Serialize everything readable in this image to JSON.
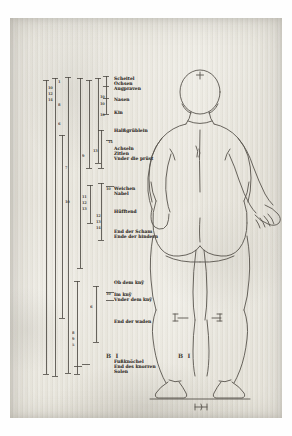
{
  "plate": {
    "title": "Vier Bücher von menschlicher Proportion – rear view female figure with proportional scales",
    "signature_left": "B I",
    "signature_right": "B I",
    "ink_color": "#3e3a34",
    "paper_color": "#e9e7df"
  },
  "labels": [
    {
      "text": "Scheitel",
      "x": 104,
      "y": 58
    },
    {
      "text": "Ochsen",
      "x": 104,
      "y": 63
    },
    {
      "text": "Augpraven",
      "x": 104,
      "y": 68
    },
    {
      "text": "Nasen",
      "x": 104,
      "y": 79
    },
    {
      "text": "Kin",
      "x": 104,
      "y": 92
    },
    {
      "text": "Halßgrüblein",
      "x": 104,
      "y": 110
    },
    {
      "text": "Achseln",
      "x": 104,
      "y": 128
    },
    {
      "text": "Zitlen",
      "x": 104,
      "y": 133
    },
    {
      "text": "Vnder die prüst",
      "x": 104,
      "y": 138
    },
    {
      "text": "Weichen",
      "x": 104,
      "y": 168
    },
    {
      "text": "Nabel",
      "x": 104,
      "y": 173
    },
    {
      "text": "Hüfftend",
      "x": 104,
      "y": 191
    },
    {
      "text": "End der Scham",
      "x": 104,
      "y": 211
    },
    {
      "text": "Ende der hindern",
      "x": 104,
      "y": 216
    },
    {
      "text": "Ob dem knÿ",
      "x": 104,
      "y": 262
    },
    {
      "text": "Im knÿ",
      "x": 104,
      "y": 274
    },
    {
      "text": "Vnder dem knÿ",
      "x": 104,
      "y": 279
    },
    {
      "text": "End der waden",
      "x": 104,
      "y": 301
    },
    {
      "text": "Fußknöchel",
      "x": 104,
      "y": 341
    },
    {
      "text": "End des knorren",
      "x": 104,
      "y": 346
    },
    {
      "text": "Solen",
      "x": 104,
      "y": 351
    }
  ],
  "scale_bars": [
    {
      "x": 36,
      "top": 62,
      "bottom": 356
    },
    {
      "x": 45,
      "top": 60,
      "bottom": 358
    },
    {
      "x": 52,
      "top": 117,
      "bottom": 300
    },
    {
      "x": 58,
      "top": 59,
      "bottom": 355
    },
    {
      "x": 67,
      "top": 263,
      "bottom": 356
    },
    {
      "x": 70,
      "top": 60,
      "bottom": 250
    },
    {
      "x": 79,
      "top": 62,
      "bottom": 150
    },
    {
      "x": 80,
      "top": 167,
      "bottom": 205
    },
    {
      "x": 86,
      "top": 268,
      "bottom": 324
    },
    {
      "x": 88,
      "top": 60,
      "bottom": 145
    },
    {
      "x": 91,
      "top": 112,
      "bottom": 150
    },
    {
      "x": 91,
      "top": 165,
      "bottom": 222
    },
    {
      "x": 96,
      "top": 58,
      "bottom": 96
    }
  ],
  "numerals": [
    {
      "text": "10",
      "x": 38,
      "y": 68
    },
    {
      "text": "12",
      "x": 38,
      "y": 74
    },
    {
      "text": "14",
      "x": 38,
      "y": 80
    },
    {
      "text": "1",
      "x": 48,
      "y": 62
    },
    {
      "text": "8",
      "x": 48,
      "y": 85
    },
    {
      "text": "6",
      "x": 48,
      "y": 104
    },
    {
      "text": "7",
      "x": 55,
      "y": 148
    },
    {
      "text": "10",
      "x": 55,
      "y": 182
    },
    {
      "text": "8",
      "x": 62,
      "y": 313
    },
    {
      "text": "9",
      "x": 62,
      "y": 319
    },
    {
      "text": "5",
      "x": 62,
      "y": 325
    },
    {
      "text": "9",
      "x": 72,
      "y": 136
    },
    {
      "text": "11",
      "x": 72,
      "y": 177
    },
    {
      "text": "12",
      "x": 72,
      "y": 183
    },
    {
      "text": "13",
      "x": 72,
      "y": 189
    },
    {
      "text": "6",
      "x": 80,
      "y": 287
    },
    {
      "text": "13",
      "x": 83,
      "y": 131
    },
    {
      "text": "12",
      "x": 86,
      "y": 196
    },
    {
      "text": "13",
      "x": 86,
      "y": 202
    },
    {
      "text": "14",
      "x": 86,
      "y": 208
    },
    {
      "text": "10",
      "x": 90,
      "y": 77
    },
    {
      "text": "10",
      "x": 90,
      "y": 84
    },
    {
      "text": "10",
      "x": 90,
      "y": 95
    },
    {
      "text": "14",
      "x": 98,
      "y": 122
    },
    {
      "text": "10",
      "x": 96,
      "y": 169
    },
    {
      "text": "10",
      "x": 96,
      "y": 274
    }
  ],
  "ticks": [
    {
      "x": 33,
      "y": 62,
      "w": 6
    },
    {
      "x": 33,
      "y": 356,
      "w": 6
    },
    {
      "x": 42,
      "y": 60,
      "w": 6
    },
    {
      "x": 42,
      "y": 358,
      "w": 6
    },
    {
      "x": 49,
      "y": 117,
      "w": 6
    },
    {
      "x": 49,
      "y": 300,
      "w": 6
    },
    {
      "x": 55,
      "y": 59,
      "w": 6
    },
    {
      "x": 55,
      "y": 355,
      "w": 6
    },
    {
      "x": 64,
      "y": 263,
      "w": 6
    },
    {
      "x": 64,
      "y": 356,
      "w": 6
    },
    {
      "x": 67,
      "y": 60,
      "w": 6
    },
    {
      "x": 67,
      "y": 250,
      "w": 6
    },
    {
      "x": 76,
      "y": 62,
      "w": 6
    },
    {
      "x": 76,
      "y": 150,
      "w": 6
    },
    {
      "x": 77,
      "y": 167,
      "w": 6
    },
    {
      "x": 77,
      "y": 205,
      "w": 6
    },
    {
      "x": 83,
      "y": 268,
      "w": 6
    },
    {
      "x": 83,
      "y": 324,
      "w": 6
    },
    {
      "x": 85,
      "y": 60,
      "w": 6
    },
    {
      "x": 85,
      "y": 145,
      "w": 6
    },
    {
      "x": 88,
      "y": 112,
      "w": 6
    },
    {
      "x": 88,
      "y": 150,
      "w": 6
    },
    {
      "x": 88,
      "y": 165,
      "w": 6
    },
    {
      "x": 88,
      "y": 222,
      "w": 6
    },
    {
      "x": 93,
      "y": 58,
      "w": 6
    },
    {
      "x": 93,
      "y": 96,
      "w": 6
    },
    {
      "x": 93,
      "y": 68,
      "w": 6
    },
    {
      "x": 93,
      "y": 80,
      "w": 6
    },
    {
      "x": 96,
      "y": 168,
      "w": 8
    },
    {
      "x": 96,
      "y": 274,
      "w": 8
    },
    {
      "x": 96,
      "y": 282,
      "w": 8
    },
    {
      "x": 96,
      "y": 122,
      "w": 6
    },
    {
      "x": 64,
      "y": 348,
      "w": 8
    },
    {
      "x": 72,
      "y": 346,
      "w": 8
    }
  ],
  "signatures": [
    {
      "text": "B I",
      "x": 96,
      "y": 334
    },
    {
      "text": "B I",
      "x": 168,
      "y": 334
    }
  ]
}
